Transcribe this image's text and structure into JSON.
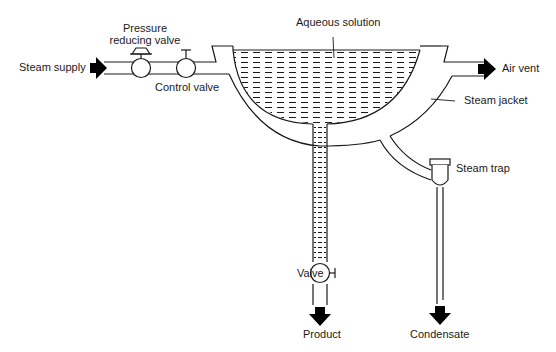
{
  "diagram": {
    "labels": {
      "steam_supply": "Steam supply",
      "pressure_reducing_valve_line1": "Pressure",
      "pressure_reducing_valve_line2": "reducing valve",
      "control_valve": "Control valve",
      "aqueous_solution": "Aqueous solution",
      "air_vent": "Air vent",
      "steam_jacket": "Steam jacket",
      "steam_trap": "Steam trap",
      "valve": "Valve",
      "product": "Product",
      "condensate": "Condensate"
    },
    "colors": {
      "line": "#1a1a1a",
      "background": "#ffffff",
      "arrow": "#000000"
    },
    "components": [
      {
        "id": "steam-supply-inlet",
        "type": "flow-arrow",
        "direction": "right"
      },
      {
        "id": "pressure-reducing-valve",
        "type": "valve"
      },
      {
        "id": "control-valve",
        "type": "valve"
      },
      {
        "id": "steam-jacket",
        "type": "vessel-jacket"
      },
      {
        "id": "pan",
        "type": "hemispherical-vessel",
        "contents": "aqueous solution"
      },
      {
        "id": "air-vent-outlet",
        "type": "flow-arrow",
        "direction": "right"
      },
      {
        "id": "steam-trap",
        "type": "trap"
      },
      {
        "id": "product-valve",
        "type": "valve"
      },
      {
        "id": "product-outlet",
        "type": "flow-arrow",
        "direction": "down"
      },
      {
        "id": "condensate-outlet",
        "type": "flow-arrow",
        "direction": "down"
      }
    ]
  }
}
